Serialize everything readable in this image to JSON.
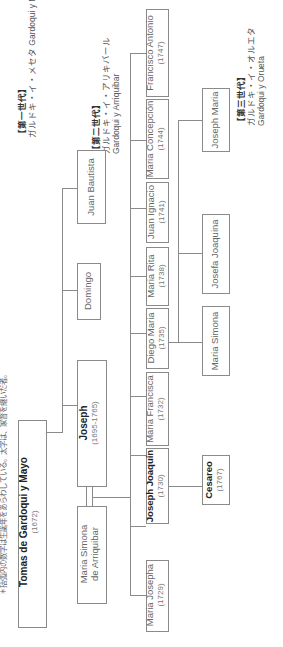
{
  "note": "＊括弧内の数字は生誕年をあらわしている。太字は、家督を継いだ者。",
  "generation_labels": {
    "gen1": {
      "heading": "【第一世代】",
      "kana": "ガルドキ・イ・メセタ",
      "latin": "Gardoqui y Meceta"
    },
    "gen2": {
      "heading": "【第二世代】",
      "kana": "ガルドキ・イ・アリキバール",
      "latin": "Gardoqui y Arriquibar"
    },
    "gen3": {
      "heading": "【第三世代】",
      "kana": "ガルドキ・イ・オルエタ",
      "latin": "Gardoqui y Orueta"
    }
  },
  "root": {
    "name": "Tomas de Gardoqui y Mayo",
    "year": "(1672)"
  },
  "gen1": [
    {
      "name": "Joseph",
      "year": "(1695-1765)",
      "heir": true
    },
    {
      "name": "Domingo",
      "year": ""
    },
    {
      "name": "Juan Bautista",
      "year": ""
    }
  ],
  "spouse": {
    "name_line1": "Maria Simona",
    "name_line2": "de Arriquibar"
  },
  "gen2": [
    {
      "name": "Maria Josepha",
      "year": "(1729)"
    },
    {
      "name": "Joseph Joaquín",
      "year": "(1730)",
      "heir": true
    },
    {
      "name": "Maria Francisca",
      "year": "(1732)"
    },
    {
      "name": "Diego Maria",
      "year": "(1735)"
    },
    {
      "name": "Maria Rita",
      "year": "(1738)"
    },
    {
      "name": "Juan Ignacio",
      "year": "(1741)"
    },
    {
      "name": "Maria Concepción",
      "year": "(1744)"
    },
    {
      "name": "Francisco Antonio",
      "year": "(1747)"
    }
  ],
  "gen3": [
    {
      "name": "Cesareo",
      "year": "(1767)",
      "heir": true,
      "parent": "Joseph Joaquín"
    },
    {
      "name": "Maria Simona",
      "year": "",
      "parent": "Diego Maria"
    },
    {
      "name": "Josefa Joaquina",
      "year": "",
      "parent": "Diego Maria"
    },
    {
      "name": "Joseph Maria",
      "year": "",
      "parent": "Diego Maria"
    }
  ]
}
